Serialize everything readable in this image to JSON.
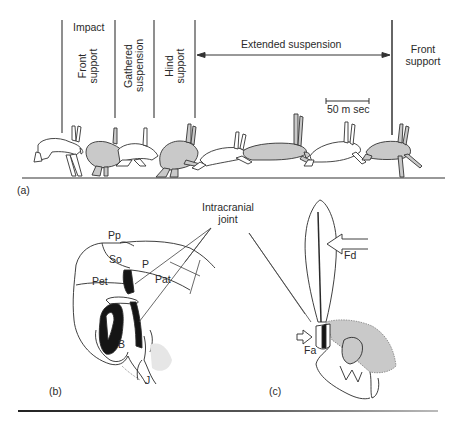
{
  "figure": {
    "panel_a": {
      "label": "(a)",
      "phases": [
        {
          "label": "Impact",
          "orientation": "horizontal"
        },
        {
          "label": "Front\nsupport",
          "line1": "Front",
          "line2": "support",
          "orientation": "vertical"
        },
        {
          "label": "Gathered\nsuspension",
          "line1": "Gathered",
          "line2": "suspension",
          "orientation": "vertical"
        },
        {
          "label": "Hind\nsupport",
          "line1": "Hind",
          "line2": "support",
          "orientation": "vertical"
        },
        {
          "label": "Extended suspension",
          "orientation": "horizontal"
        },
        {
          "label": "Front\nsupport",
          "line1": "Front",
          "line2": "support",
          "orientation": "horizontal"
        }
      ],
      "scale_bar": "50 m sec",
      "figures": [
        "hare-1-white",
        "hare-2-grey",
        "hare-3-white",
        "hare-4-grey",
        "hare-5-white",
        "hare-6-grey",
        "hare-7-white",
        "hare-8-grey"
      ]
    },
    "panel_b": {
      "label": "(b)",
      "structures": [
        "Pp",
        "So",
        "P",
        "Pet",
        "Pat",
        "B",
        "J"
      ]
    },
    "shared_label": {
      "line1": "Intracranial",
      "line2": "joint"
    },
    "panel_c": {
      "label": "(c)",
      "forces": [
        "Fd",
        "Fa"
      ]
    },
    "colors": {
      "line": "#2a2a2a",
      "fill_grey": "#c9c9c9",
      "fill_dark": "#151515",
      "background": "#ffffff"
    }
  }
}
